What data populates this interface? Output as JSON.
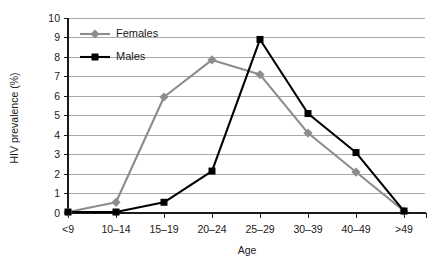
{
  "chart_data": {
    "type": "line",
    "title": "",
    "xlabel": "Age",
    "ylabel": "HIV prevalence (%)",
    "categories": [
      "<9",
      "10–14",
      "15–19",
      "20–24",
      "25–29",
      "30–39",
      "40–49",
      ">49"
    ],
    "ylim": [
      0,
      10
    ],
    "ytick_labels": [
      "0",
      "1",
      "2",
      "3",
      "4",
      "5",
      "6",
      "7",
      "8",
      "9",
      "10"
    ],
    "ytick_values": [
      0,
      1,
      2,
      3,
      4,
      5,
      6,
      7,
      8,
      9,
      10
    ],
    "grid": true,
    "grid_axis": "y",
    "legend_position": "top-left-inside",
    "series": [
      {
        "name": "Females",
        "color": "#8c8c8c",
        "marker": "diamond",
        "values": [
          0.05,
          0.55,
          5.95,
          7.85,
          7.1,
          4.1,
          2.1,
          0.1
        ]
      },
      {
        "name": "Males",
        "color": "#000000",
        "marker": "square",
        "values": [
          0.05,
          0.05,
          0.55,
          2.15,
          8.9,
          5.1,
          3.1,
          0.1
        ]
      }
    ]
  },
  "colors": {
    "background": "#ffffff",
    "axis": "#1a1a1a",
    "gridline": "#a8a8a8",
    "females": "#8c8c8c",
    "males": "#000000",
    "text": "#1a1a1a"
  },
  "legend": {
    "items": [
      {
        "label": "Females",
        "color": "#8c8c8c",
        "marker": "diamond"
      },
      {
        "label": "Males",
        "color": "#000000",
        "marker": "square"
      }
    ]
  }
}
